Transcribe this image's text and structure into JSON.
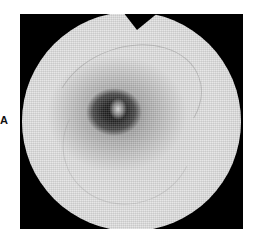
{
  "figure": {
    "panel_label": "A",
    "colors": {
      "background": "#ffffff",
      "frame": "#000000",
      "retina": "#e0e0e0",
      "macula": "#1a1a1a"
    }
  }
}
